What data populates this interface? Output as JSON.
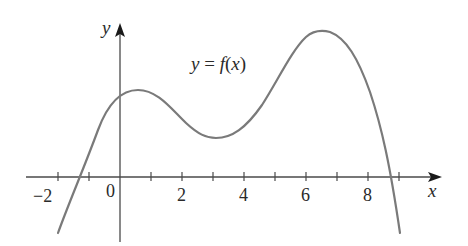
{
  "chart_data": {
    "type": "line",
    "title": "",
    "equation_label": "y = f(x)",
    "equation_parts": {
      "y": "y",
      "eq": " = ",
      "f": "f",
      "open": "(",
      "x": "x",
      "close": ")"
    },
    "xlabel": "x",
    "ylabel": "y",
    "origin_label": "0",
    "xlim": [
      -3.5,
      10.5
    ],
    "x_ticks": [
      -2,
      -1,
      1,
      2,
      3,
      4,
      5,
      6,
      7,
      8,
      9
    ],
    "x_tick_labels": [
      "−2",
      "2",
      "4",
      "6",
      "8"
    ],
    "x_tick_label_values": [
      -2,
      2,
      4,
      6,
      8
    ],
    "y_ticks_shown": false,
    "grid": false,
    "legend": null,
    "series": [
      {
        "name": "f(x)",
        "x": [
          -2.0,
          -1.5,
          -1.0,
          -0.5,
          0.0,
          0.6,
          1.0,
          1.5,
          2.0,
          2.5,
          3.0,
          3.5,
          4.0,
          4.5,
          5.0,
          5.5,
          6.0,
          6.5,
          7.0,
          7.5,
          8.0,
          8.5,
          8.65,
          9.0
        ],
        "y": [
          -1.8,
          -0.9,
          -0.1,
          0.9,
          1.7,
          2.8,
          2.7,
          2.2,
          1.6,
          1.3,
          1.3,
          1.4,
          1.8,
          2.4,
          3.2,
          4.0,
          4.6,
          4.8,
          4.5,
          3.6,
          2.2,
          0.5,
          0.0,
          -1.8
        ]
      }
    ],
    "features": {
      "x_intercepts_approx": [
        -1.1,
        8.65
      ],
      "local_max_approx": {
        "x": 0.6,
        "y": 2.8
      },
      "local_min_approx": {
        "x": 3.1,
        "y": 1.3
      },
      "global_max_approx": {
        "x": 6.5,
        "y": 4.8
      }
    },
    "colors": {
      "curve": "#7a7a7a",
      "axes": "#333333",
      "text": "#2a2a2a"
    }
  }
}
